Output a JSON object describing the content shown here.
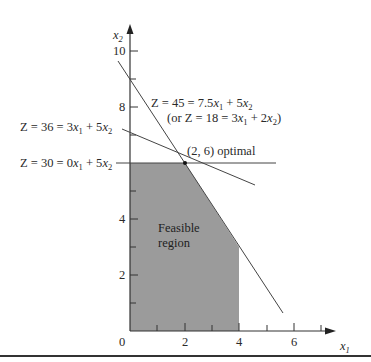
{
  "figure": {
    "type": "linear-programming-graphical-solution",
    "axes": {
      "x_label": "x1",
      "y_label": "x2",
      "x_ticks": [
        "0",
        "2",
        "4",
        "6"
      ],
      "y_ticks": [
        "2",
        "4",
        "8",
        "10"
      ],
      "x_range": [
        0,
        7
      ],
      "y_range": [
        0,
        10
      ]
    },
    "feasible_region": {
      "label_line1": "Feasible",
      "label_line2": "region",
      "vertices": [
        [
          0,
          0
        ],
        [
          0,
          6
        ],
        [
          2,
          6
        ],
        [
          4,
          3
        ],
        [
          4,
          0
        ]
      ],
      "fill": "#9a9a9a"
    },
    "lines": [
      {
        "id": "z30",
        "label": "Z = 30 = 0x1 + 5x2",
        "from": [
          0,
          6
        ],
        "to": [
          5.5,
          6
        ]
      },
      {
        "id": "z36",
        "label": "Z = 36 = 3x1 + 5x2",
        "from": [
          -0.4,
          7.44
        ],
        "to": [
          4.5,
          4.5
        ]
      },
      {
        "id": "z45",
        "label": "Z = 45 = 7.5x1 + 5x2",
        "sublabel": "(or Z = 18 = 3x1 + 2x2)",
        "from": [
          -0.4,
          9.6
        ],
        "to": [
          5.6,
          0.6
        ]
      }
    ],
    "optimal_point": {
      "coords": [
        2,
        6
      ],
      "label": "(2, 6) optimal"
    }
  },
  "text": {
    "x_axis_label": "x",
    "x_axis_sub": "1",
    "y_axis_label": "x",
    "y_axis_sub": "2",
    "tick_x_0": "0",
    "tick_x_2": "2",
    "tick_x_4": "4",
    "tick_x_6": "6",
    "tick_y_2": "2",
    "tick_y_4": "4",
    "tick_y_8": "8",
    "tick_y_10": "10",
    "feasible_line1": "Feasible",
    "feasible_line2": "region",
    "optimal_label": "(2, 6) optimal",
    "z30_prefix": "Z = 30 = 0",
    "z36_prefix": "Z = 36 = 3",
    "z45_prefix": "Z = 45 = 7.5",
    "z45_alt_prefix": "(or Z = 18 = 3"
  }
}
